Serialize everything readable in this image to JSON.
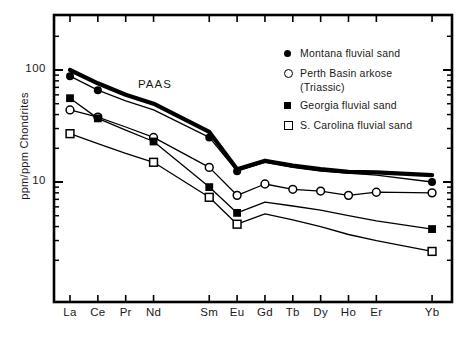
{
  "chart_data": {
    "type": "line",
    "title": "",
    "xlabel": "",
    "ylabel": "ppm/ppm Chondrites",
    "yscale": "log",
    "ylim": [
      2,
      200
    ],
    "ytick_labels": [
      "100",
      "10"
    ],
    "ytick_values": [
      100,
      10
    ],
    "categories": [
      "La",
      "Ce",
      "Pr",
      "Nd",
      "Sm",
      "Eu",
      "Gd",
      "Tb",
      "Dy",
      "Ho",
      "Er",
      "Yb"
    ],
    "grid": false,
    "legend_position": "upper right",
    "annotations": [
      {
        "text": "PAAS",
        "x": "Nd",
        "y": 70
      }
    ],
    "series": [
      {
        "name": "PAAS",
        "marker": "none",
        "line": "thick",
        "values": [
          100,
          76,
          60,
          50,
          28,
          13,
          15.5,
          14,
          13,
          12.3,
          12.2,
          11.5
        ]
      },
      {
        "name": "Montana fluvial sand",
        "marker": "filled-circle",
        "line": "thin",
        "markers_at": [
          "La",
          "Ce",
          "Sm",
          "Eu",
          "Yb"
        ],
        "values": [
          88,
          66,
          53,
          44,
          25,
          12.5,
          15,
          13.5,
          12.5,
          12,
          11.5,
          10
        ]
      },
      {
        "name": "Perth Basin arkose (Triassic)",
        "marker": "open-circle",
        "line": "thin",
        "markers_at": [
          "La",
          "Ce",
          "Nd",
          "Sm",
          "Eu",
          "Gd",
          "Tb",
          "Dy",
          "Ho",
          "Er",
          "Yb"
        ],
        "values": [
          44,
          38,
          31,
          25,
          13.5,
          7.6,
          9.6,
          8.6,
          8.3,
          7.6,
          8.1,
          8.0
        ]
      },
      {
        "name": "Georgia fluvial sand",
        "marker": "filled-square",
        "line": "thin",
        "markers_at": [
          "La",
          "Ce",
          "Nd",
          "Sm",
          "Eu",
          "Yb"
        ],
        "values": [
          56,
          37,
          29,
          23,
          9.0,
          5.3,
          6.6,
          6.1,
          5.6,
          5.0,
          4.5,
          3.8
        ]
      },
      {
        "name": "S. Carolina fluvial sand",
        "marker": "open-square",
        "line": "thin",
        "markers_at": [
          "La",
          "Nd",
          "Sm",
          "Eu",
          "Yb"
        ],
        "values": [
          27,
          22,
          18,
          15,
          7.3,
          4.2,
          5.2,
          4.6,
          4.0,
          3.4,
          3.0,
          2.4
        ]
      }
    ]
  },
  "legend": {
    "items": [
      {
        "symbol": "filled-circle",
        "label": "Montana fluvial sand",
        "sublabel": ""
      },
      {
        "symbol": "open-circle",
        "label": "Perth Basin arkose",
        "sublabel": "(Triassic)"
      },
      {
        "symbol": "filled-square",
        "label": "Georgia fluvial sand",
        "sublabel": ""
      },
      {
        "symbol": "open-square",
        "label": "S. Carolina fluvial sand",
        "sublabel": ""
      }
    ]
  },
  "axes": {
    "y_title": "ppm/ppm Chondrites",
    "y_labels": [
      "100",
      "10"
    ],
    "x_labels": [
      "La",
      "Ce",
      "Pr",
      "Nd",
      "Sm",
      "Eu",
      "Gd",
      "Tb",
      "Dy",
      "Ho",
      "Er",
      "Yb"
    ]
  },
  "annotation_paas": "PAAS"
}
